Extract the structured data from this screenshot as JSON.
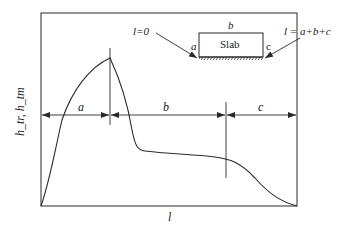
{
  "diagram": {
    "type": "slab-profile",
    "y_axis_label": "h_tr, h_tm",
    "x_axis_label": "l",
    "segments": [
      {
        "name": "a",
        "label": "a"
      },
      {
        "name": "b",
        "label": "b"
      },
      {
        "name": "c",
        "label": "c"
      }
    ],
    "inset": {
      "slab_label": "Slab",
      "top_label": "b",
      "left_label": "a",
      "right_label": "c",
      "start_annotation": "l=0",
      "end_annotation": "l = a+b+c"
    }
  },
  "colors": {
    "line": "#2a2a2a",
    "background": "#ffffff"
  }
}
